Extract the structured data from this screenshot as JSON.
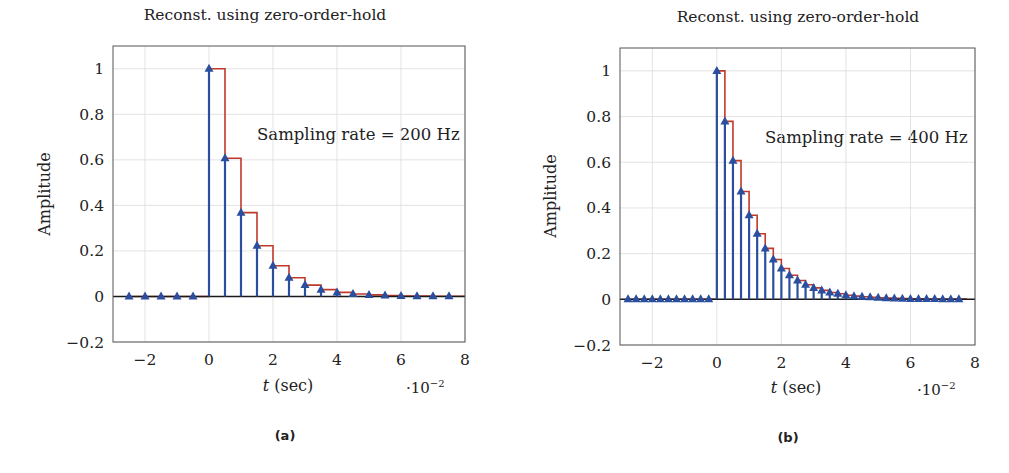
{
  "colors": {
    "stem": "#2b4f9e",
    "zoh": "#c0392b",
    "grid": "#dcdcdc",
    "axis_box": "#555555",
    "zero_line": "#1a1a1a"
  },
  "panels": [
    {
      "caption": "(a)",
      "title": "Reconst. using zero-order-hold",
      "ylabel": "Amplitude",
      "xlabel_var": "t",
      "xlabel_unit": " (sec)",
      "x_scale_prefix": "·10",
      "x_scale_exp": "−2",
      "annotation": "Sampling rate = 200 Hz"
    },
    {
      "caption": "(b)",
      "title": "Reconst. using zero-order-hold",
      "ylabel": "Amplitude",
      "xlabel_var": "t",
      "xlabel_unit": " (sec)",
      "x_scale_prefix": "·10",
      "x_scale_exp": "−2",
      "annotation": "Sampling rate = 400 Hz"
    }
  ],
  "chart_data": [
    {
      "type": "stem+step",
      "title": "Reconst. using zero-order-hold",
      "xlabel": "t (sec)",
      "x_multiplier": "10^-2",
      "ylabel": "Amplitude",
      "xlim": [
        -3,
        8
      ],
      "ylim": [
        -0.2,
        1.1
      ],
      "xticks": [
        -2,
        0,
        2,
        4,
        6,
        8
      ],
      "yticks": [
        -0.2,
        0,
        0.2,
        0.4,
        0.6,
        0.8,
        1
      ],
      "ytick_labels": [
        "−0.2",
        "0",
        "0.2",
        "0.4",
        "0.6",
        "0.8",
        "1"
      ],
      "xtick_labels": [
        "−2",
        "0",
        "2",
        "4",
        "6",
        "8"
      ],
      "grid": true,
      "annotation": "Sampling rate = 200 Hz",
      "sample_period": 0.5,
      "series": [
        {
          "name": "samples (stem, triangle markers)",
          "x": [
            -2.5,
            -2.0,
            -1.5,
            -1.0,
            -0.5,
            0.0,
            0.5,
            1.0,
            1.5,
            2.0,
            2.5,
            3.0,
            3.5,
            4.0,
            4.5,
            5.0,
            5.5,
            6.0,
            6.5,
            7.0,
            7.5
          ],
          "values": [
            0,
            0,
            0,
            0,
            0,
            1.0,
            0.607,
            0.368,
            0.223,
            0.135,
            0.082,
            0.05,
            0.03,
            0.018,
            0.011,
            0.007,
            0.004,
            0.002,
            0.0015,
            0.0009,
            0.0006
          ]
        },
        {
          "name": "zero-order-hold reconstruction (step)",
          "note": "holds each sample value for one sample period"
        }
      ]
    },
    {
      "type": "stem+step",
      "title": "Reconst. using zero-order-hold",
      "xlabel": "t (sec)",
      "x_multiplier": "10^-2",
      "ylabel": "Amplitude",
      "xlim": [
        -3,
        8
      ],
      "ylim": [
        -0.2,
        1.1
      ],
      "xticks": [
        -2,
        0,
        2,
        4,
        6,
        8
      ],
      "yticks": [
        -0.2,
        0,
        0.2,
        0.4,
        0.6,
        0.8,
        1
      ],
      "ytick_labels": [
        "−0.2",
        "0",
        "0.2",
        "0.4",
        "0.6",
        "0.8",
        "1"
      ],
      "xtick_labels": [
        "−2",
        "0",
        "2",
        "4",
        "6",
        "8"
      ],
      "grid": true,
      "annotation": "Sampling rate = 400 Hz",
      "sample_period": 0.25,
      "series": [
        {
          "name": "samples (stem, triangle markers)",
          "x": [
            -2.75,
            -2.5,
            -2.25,
            -2.0,
            -1.75,
            -1.5,
            -1.25,
            -1.0,
            -0.75,
            -0.5,
            -0.25,
            0.0,
            0.25,
            0.5,
            0.75,
            1.0,
            1.25,
            1.5,
            1.75,
            2.0,
            2.25,
            2.5,
            2.75,
            3.0,
            3.25,
            3.5,
            3.75,
            4.0,
            4.25,
            4.5,
            4.75,
            5.0,
            5.25,
            5.5,
            5.75,
            6.0,
            6.25,
            6.5,
            6.75,
            7.0,
            7.25,
            7.5
          ],
          "values": [
            0,
            0,
            0,
            0,
            0,
            0,
            0,
            0,
            0,
            0,
            0,
            1.0,
            0.779,
            0.607,
            0.472,
            0.368,
            0.287,
            0.223,
            0.174,
            0.135,
            0.105,
            0.082,
            0.064,
            0.05,
            0.039,
            0.03,
            0.024,
            0.018,
            0.014,
            0.011,
            0.009,
            0.007,
            0.005,
            0.004,
            0.003,
            0.002,
            0.002,
            0.0015,
            0.0012,
            0.0009,
            0.0007,
            0.0006
          ]
        },
        {
          "name": "zero-order-hold reconstruction (step)",
          "note": "holds each sample value for one sample period"
        }
      ]
    }
  ],
  "layout": {
    "panels": [
      {
        "box": [
          113,
          46,
          465,
          342
        ]
      },
      {
        "box": [
          620,
          48,
          975,
          345
        ]
      }
    ]
  }
}
